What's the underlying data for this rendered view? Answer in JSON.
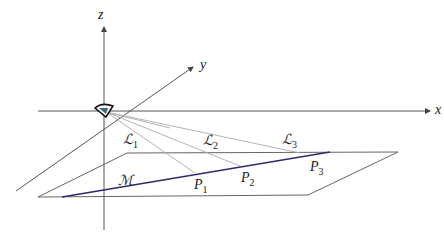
{
  "axes": {
    "x_label": "x",
    "y_label": "y",
    "z_label": "z"
  },
  "plane_label": "ℳ",
  "lines": [
    {
      "label": "ℒ",
      "sub": "1"
    },
    {
      "label": "ℒ",
      "sub": "2"
    },
    {
      "label": "ℒ",
      "sub": "3"
    }
  ],
  "points": [
    {
      "label": "P",
      "sub": "1"
    },
    {
      "label": "P",
      "sub": "2"
    },
    {
      "label": "P",
      "sub": "3"
    }
  ],
  "colors": {
    "axis": "#555555",
    "ray": "#aaaaaa",
    "plane": "#666666",
    "line_m": "#2e2a6e"
  }
}
